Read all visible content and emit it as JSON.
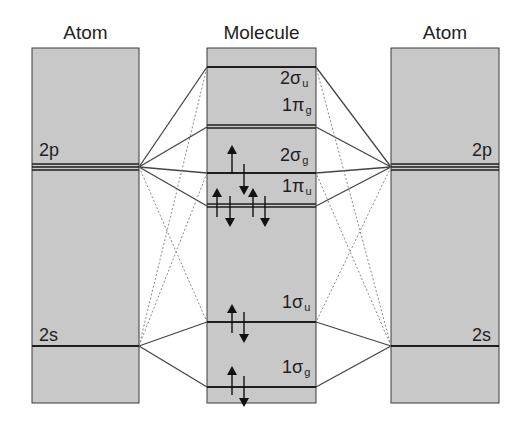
{
  "diagram": {
    "type": "molecular-orbital-diagram",
    "colors": {
      "panel_fill": "#c8c8c8",
      "line": "#1e1e1e",
      "connector": "#444444",
      "dotted": "#8a8a8a"
    },
    "columns": {
      "left": {
        "title": "Atom"
      },
      "middle": {
        "title": "Molecule"
      },
      "right": {
        "title": "Atom"
      }
    },
    "atomic_levels": {
      "left": [
        {
          "label": "2p",
          "main": "2",
          "sub": "p"
        },
        {
          "label": "2s",
          "main": "2",
          "sub": "s"
        }
      ],
      "right": [
        {
          "label": "2p"
        },
        {
          "label": "2s"
        }
      ]
    },
    "molecular_levels": [
      {
        "label": "2σu",
        "main": "2σ",
        "sub": "u",
        "electrons": 0
      },
      {
        "label": "1πg",
        "main": "1π",
        "sub": "g",
        "electrons": 0
      },
      {
        "label": "2σg",
        "main": "2σ",
        "sub": "g",
        "electrons": 2
      },
      {
        "label": "1πu",
        "main": "1π",
        "sub": "u",
        "electrons": 4
      },
      {
        "label": "1σu",
        "main": "1σ",
        "sub": "u",
        "electrons": 2
      },
      {
        "label": "1σg",
        "main": "1σ",
        "sub": "g",
        "electrons": 2
      }
    ],
    "atom_labels": {
      "left_2p": "2p",
      "left_2s": "2s",
      "right_2p": "2p",
      "right_2s": "2s"
    }
  }
}
